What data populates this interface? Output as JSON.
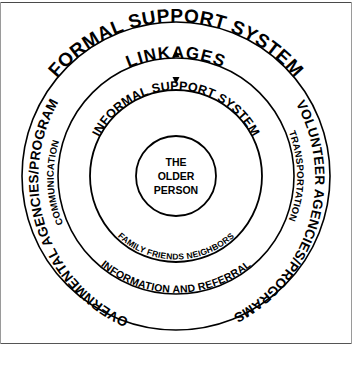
{
  "diagram": {
    "type": "concentric-rings",
    "center": {
      "line1": "THE",
      "line2": "OLDER",
      "line3": "PERSON"
    },
    "rings": [
      {
        "index": 0,
        "name": "core",
        "labels": [
          "THE",
          "OLDER",
          "PERSON"
        ]
      },
      {
        "index": 1,
        "name": "informal-support-system",
        "top_label": "INFORMAL SUPPORT SYSTEM",
        "bottom_label": "FAMILY FRIENDS NEIGHBORS"
      },
      {
        "index": 2,
        "name": "linkages",
        "top_label": "LINKAGES",
        "bottom_label": "INFORMATION AND REFERRAL",
        "left_label": "COMMUNICATION",
        "right_label": "TRANSPORTATION"
      },
      {
        "index": 3,
        "name": "formal-support-system",
        "top_label": "FORMAL SUPPORT SYSTEM",
        "left_label": "GOVERNMENTAL AGENCIES/PROGRAMS",
        "right_label": "VOLUNTEER AGENCIES/PROGRAMS"
      }
    ],
    "arrows": [
      {
        "name": "linkage-arrow-up",
        "direction": "up"
      },
      {
        "name": "linkage-arrow-down",
        "direction": "down"
      }
    ],
    "colors": {
      "stroke": "#000000",
      "background": "#ffffff",
      "frame": "#555555"
    }
  }
}
